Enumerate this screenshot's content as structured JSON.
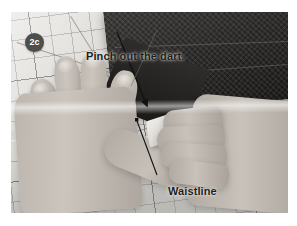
{
  "figure": {
    "step_badge": "2c",
    "caption_annotations": [
      {
        "id": "pinch",
        "text": "Pinch out the dart."
      },
      {
        "id": "waistline",
        "text": "Waistline"
      }
    ],
    "scene_description": "Two hands pinching a dart in gridded fabric on a cutting mat",
    "colors": {
      "badge_fill": "#4e4e4c",
      "badge_text": "#ffffff",
      "annotation_text": "#1d1d1b",
      "arrow": "#111111",
      "page_background": "#ffffff",
      "denim_dark": "#201f1d",
      "paper_light": "#e6e5e2"
    }
  }
}
